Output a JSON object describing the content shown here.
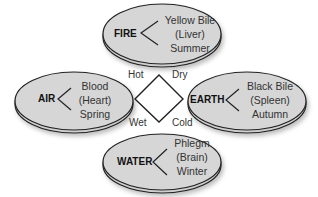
{
  "diagram": {
    "type": "four humors",
    "center": {
      "corners": {
        "top_left": "Hot",
        "top_right": "Dry",
        "bottom_left": "Wet",
        "bottom_right": "Cold"
      }
    },
    "elements": [
      {
        "name": "FIRE",
        "humor": "Yellow Bile",
        "organ": "(Liver)",
        "season": "Summer"
      },
      {
        "name": "AIR",
        "humor": "Blood",
        "organ": "(Heart)",
        "season": "Spring"
      },
      {
        "name": "EARTH",
        "humor": "Black Bile",
        "organ": "(Spleen)",
        "season": "Autumn"
      },
      {
        "name": "WATER",
        "humor": "Phlegm",
        "organ": "(Brain)",
        "season": "Winter"
      }
    ],
    "colors": {
      "ellipse_fill": "#d4d4d4",
      "outline": "#222222"
    }
  }
}
